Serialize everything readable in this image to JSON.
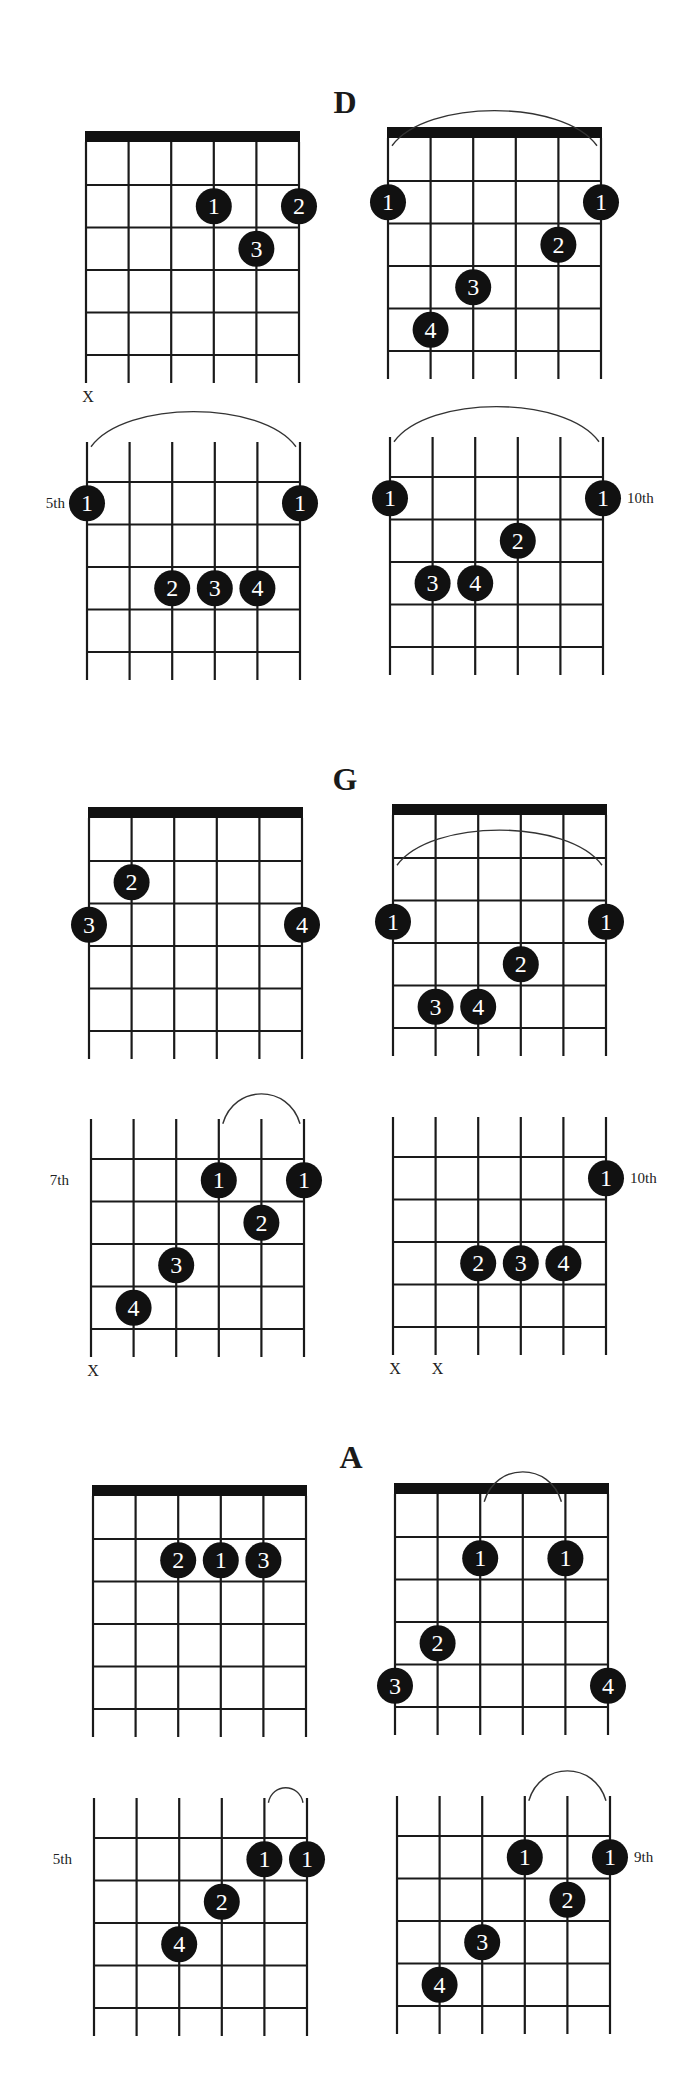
{
  "page": {
    "width": 695,
    "height": 2095,
    "colors": {
      "ink": "#111111",
      "line": "#1a1a1a",
      "arc": "#333333",
      "dot_text": "#ffffff",
      "background": "#ffffff"
    }
  },
  "layout": {
    "string_count": 6,
    "grid_width": 213,
    "fret_spacing": 42.5,
    "fret_lines": 5,
    "nut_height": 11,
    "nut_gap": 43,
    "open_top_gap": 40,
    "tail": 28,
    "dot_radius": 18
  },
  "sections": [
    {
      "title": "D",
      "title_x": 345,
      "title_y": 86,
      "diagrams": [
        {
          "id": "d-1",
          "x0": 86,
          "line1": 185,
          "nut": true,
          "position_label": null,
          "muted": [
            1
          ],
          "barre": null,
          "fingers": [
            {
              "finger": "1",
              "string": 4,
              "row": 1
            },
            {
              "finger": "2",
              "string": 6,
              "row": 1
            },
            {
              "finger": "3",
              "string": 5,
              "row": 2
            }
          ]
        },
        {
          "id": "d-2",
          "x0": 388,
          "line1": 181,
          "nut": true,
          "position_label": null,
          "muted": [],
          "barre": {
            "from": 1,
            "to": 6,
            "row": 1
          },
          "fingers": [
            {
              "finger": "1",
              "string": 1,
              "row": 1
            },
            {
              "finger": "1",
              "string": 6,
              "row": 1
            },
            {
              "finger": "2",
              "string": 5,
              "row": 2
            },
            {
              "finger": "3",
              "string": 3,
              "row": 3
            },
            {
              "finger": "4",
              "string": 2,
              "row": 4
            }
          ]
        },
        {
          "id": "d-3",
          "x0": 87,
          "line1": 482,
          "nut": false,
          "position_label": "5th",
          "label_side": "left",
          "muted": [],
          "barre": {
            "from": 1,
            "to": 6,
            "row": 1
          },
          "fingers": [
            {
              "finger": "1",
              "string": 1,
              "row": 1
            },
            {
              "finger": "1",
              "string": 6,
              "row": 1
            },
            {
              "finger": "2",
              "string": 3,
              "row": 3
            },
            {
              "finger": "3",
              "string": 4,
              "row": 3
            },
            {
              "finger": "4",
              "string": 5,
              "row": 3
            }
          ]
        },
        {
          "id": "d-4",
          "x0": 390,
          "line1": 477,
          "nut": false,
          "position_label": "10th",
          "label_side": "right",
          "muted": [],
          "barre": {
            "from": 1,
            "to": 6,
            "row": 1
          },
          "fingers": [
            {
              "finger": "1",
              "string": 1,
              "row": 1
            },
            {
              "finger": "1",
              "string": 6,
              "row": 1
            },
            {
              "finger": "2",
              "string": 4,
              "row": 2
            },
            {
              "finger": "3",
              "string": 2,
              "row": 3
            },
            {
              "finger": "4",
              "string": 3,
              "row": 3
            }
          ]
        }
      ]
    },
    {
      "title": "G",
      "title_x": 345,
      "title_y": 763,
      "diagrams": [
        {
          "id": "g-1",
          "x0": 89,
          "line1": 861,
          "nut": true,
          "position_label": null,
          "muted": [],
          "barre": null,
          "fingers": [
            {
              "finger": "2",
              "string": 2,
              "row": 1
            },
            {
              "finger": "3",
              "string": 1,
              "row": 2
            },
            {
              "finger": "4",
              "string": 6,
              "row": 2
            }
          ]
        },
        {
          "id": "g-2",
          "x0": 393,
          "line1": 858,
          "nut": true,
          "position_label": null,
          "muted": [],
          "barre": {
            "from": 1,
            "to": 6,
            "row": 2
          },
          "fingers": [
            {
              "finger": "1",
              "string": 1,
              "row": 2
            },
            {
              "finger": "1",
              "string": 6,
              "row": 2
            },
            {
              "finger": "2",
              "string": 4,
              "row": 3
            },
            {
              "finger": "3",
              "string": 2,
              "row": 4
            },
            {
              "finger": "4",
              "string": 3,
              "row": 4
            }
          ]
        },
        {
          "id": "g-3",
          "x0": 91,
          "line1": 1159,
          "nut": false,
          "position_label": "7th",
          "label_side": "left",
          "muted": [
            1
          ],
          "barre": {
            "from": 4,
            "to": 6,
            "row": 1
          },
          "fingers": [
            {
              "finger": "1",
              "string": 4,
              "row": 1
            },
            {
              "finger": "1",
              "string": 6,
              "row": 1
            },
            {
              "finger": "2",
              "string": 5,
              "row": 2
            },
            {
              "finger": "3",
              "string": 3,
              "row": 3
            },
            {
              "finger": "4",
              "string": 2,
              "row": 4
            }
          ]
        },
        {
          "id": "g-4",
          "x0": 393,
          "line1": 1157,
          "nut": false,
          "position_label": "10th",
          "label_side": "right",
          "muted": [
            1,
            2
          ],
          "barre": null,
          "fingers": [
            {
              "finger": "1",
              "string": 6,
              "row": 1
            },
            {
              "finger": "2",
              "string": 3,
              "row": 3
            },
            {
              "finger": "3",
              "string": 4,
              "row": 3
            },
            {
              "finger": "4",
              "string": 5,
              "row": 3
            }
          ]
        }
      ]
    },
    {
      "title": "A",
      "title_x": 351,
      "title_y": 1441,
      "diagrams": [
        {
          "id": "a-1",
          "x0": 93,
          "line1": 1539,
          "nut": true,
          "position_label": null,
          "muted": [],
          "barre": null,
          "fingers": [
            {
              "finger": "2",
              "string": 3,
              "row": 1
            },
            {
              "finger": "1",
              "string": 4,
              "row": 1
            },
            {
              "finger": "3",
              "string": 5,
              "row": 1
            }
          ]
        },
        {
          "id": "a-2",
          "x0": 395,
          "line1": 1537,
          "nut": true,
          "position_label": null,
          "muted": [],
          "barre": {
            "from": 3,
            "to": 5,
            "row": 1
          },
          "fingers": [
            {
              "finger": "1",
              "string": 3,
              "row": 1
            },
            {
              "finger": "1",
              "string": 5,
              "row": 1
            },
            {
              "finger": "2",
              "string": 2,
              "row": 3
            },
            {
              "finger": "3",
              "string": 1,
              "row": 4
            },
            {
              "finger": "4",
              "string": 6,
              "row": 4
            }
          ]
        },
        {
          "id": "a-3",
          "x0": 94,
          "line1": 1838,
          "nut": false,
          "position_label": "5th",
          "label_side": "left",
          "muted": [],
          "barre": {
            "from": 5,
            "to": 6,
            "row": 1
          },
          "fingers": [
            {
              "finger": "1",
              "string": 5,
              "row": 1
            },
            {
              "finger": "1",
              "string": 6,
              "row": 1
            },
            {
              "finger": "2",
              "string": 4,
              "row": 2
            },
            {
              "finger": "4",
              "string": 3,
              "row": 3
            }
          ]
        },
        {
          "id": "a-4",
          "x0": 397,
          "line1": 1836,
          "nut": false,
          "position_label": "9th",
          "label_side": "right",
          "muted": [],
          "barre": {
            "from": 4,
            "to": 6,
            "row": 1
          },
          "fingers": [
            {
              "finger": "1",
              "string": 4,
              "row": 1
            },
            {
              "finger": "1",
              "string": 6,
              "row": 1
            },
            {
              "finger": "2",
              "string": 5,
              "row": 2
            },
            {
              "finger": "3",
              "string": 3,
              "row": 3
            },
            {
              "finger": "4",
              "string": 2,
              "row": 4
            }
          ]
        }
      ]
    }
  ],
  "mute_symbol": "X"
}
